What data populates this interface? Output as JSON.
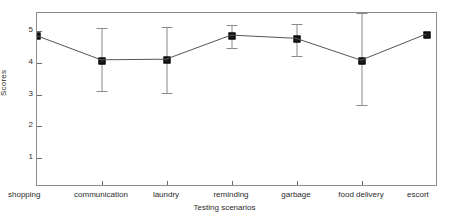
{
  "chart_data": {
    "type": "line",
    "title": "",
    "xlabel": "Testing scenarios",
    "ylabel": "Scores",
    "categories": [
      "shopping",
      "communication",
      "laundry",
      "reminding",
      "garbage",
      "food delivery",
      "escort"
    ],
    "values": [
      4.83,
      4.06,
      4.08,
      4.84,
      4.74,
      4.05,
      4.87
    ],
    "error_low": [
      4.83,
      3.12,
      3.06,
      4.45,
      4.2,
      2.68,
      4.87
    ],
    "error_high": [
      4.83,
      5.1,
      5.12,
      5.19,
      5.23,
      5.57,
      4.87
    ],
    "has_error_bars": [
      false,
      true,
      true,
      true,
      true,
      true,
      false
    ],
    "ylim": [
      0.4,
      5.5
    ],
    "xlim": [
      0,
      8
    ],
    "yticks": [
      1,
      2,
      3,
      4,
      5
    ],
    "ytick_labels": [
      "1",
      "2",
      "3",
      "4",
      "5"
    ],
    "grid": false,
    "legend": null,
    "marker": "square",
    "line_color": "#555555",
    "marker_color": "#1b1b1b",
    "error_color": "#8a8a8a",
    "frame_color": "#8c8c8c",
    "background": "#ffffff"
  }
}
